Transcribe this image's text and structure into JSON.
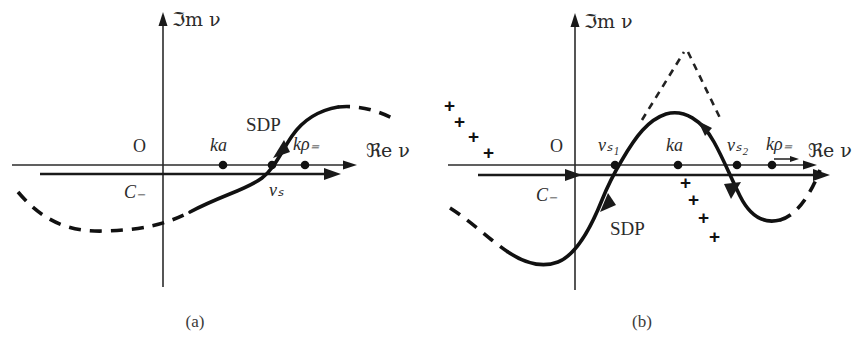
{
  "figure": {
    "width": 859,
    "height": 345,
    "background": "#ffffff",
    "ink_color": "#111111",
    "axis_color": "#2b2b2b"
  },
  "panels": [
    {
      "id": "a",
      "caption": "(a)",
      "axes": {
        "y_label": "ℑm ν",
        "x_label": "ℜe ν",
        "origin_label": "O",
        "origin_x": 163,
        "origin_y": 165
      },
      "contour": {
        "label": "C₋",
        "label_x": 128,
        "label_y": 193,
        "y": 174,
        "x_start": 12,
        "x_end": 318
      },
      "points": [
        {
          "label": "ka",
          "x": 223,
          "y": 165,
          "label_x": 223,
          "label_y": 148
        },
        {
          "label": "νₛ",
          "x": 272,
          "y": 165,
          "label_x": 281,
          "label_y": 191
        },
        {
          "label": "kρ₌",
          "x": 305,
          "y": 165,
          "label_x": 308,
          "label_y": 147
        }
      ],
      "curve": {
        "name": "SDP",
        "label": "SDP",
        "label_x": 249,
        "label_y": 126,
        "description": "monotonically increasing S-shaped steepest descent path crossing the real axis at nu_s, solid in the middle, dashed at both far ends",
        "direction": "upward"
      }
    },
    {
      "id": "b",
      "caption": "(b)",
      "axes": {
        "y_label": "ℑm ν",
        "x_label": "ℜe ν",
        "origin_label": "O",
        "origin_x": 145,
        "origin_y": 165
      },
      "contour": {
        "label": "C₋",
        "label_x": 108,
        "label_y": 196,
        "y": 175,
        "x_start": 18,
        "x_end": 398
      },
      "points": [
        {
          "label": "νₛ₁",
          "x": 185,
          "y": 165,
          "label_x": 180,
          "label_y": 148
        },
        {
          "label": "ka",
          "x": 248,
          "y": 165,
          "label_x": 249,
          "label_y": 148
        },
        {
          "label": "νₛ₂",
          "x": 307,
          "y": 165,
          "label_x": 312,
          "label_y": 148
        },
        {
          "label": "kρ₌",
          "x": 342,
          "y": 165,
          "label_x": 350,
          "label_y": 147
        }
      ],
      "curve": {
        "name": "SDP",
        "label": "SDP",
        "label_x": 205,
        "label_y": 228,
        "description": "sinusoidal steepest descent path rising through nu_s1, peaking between nu_s1 and nu_s2, descending through nu_s2; solid in the middle, dashed at both far ends",
        "direction": "upward then downward"
      },
      "dashed_peak": {
        "description": "dashed inverted-V spike above the solid hump",
        "apex_x": 256,
        "apex_y": 53
      },
      "plus_groups": [
        {
          "name": "left-branch-cut-crosses",
          "count": 4,
          "positions": [
            [
              14,
              112
            ],
            [
              24,
              127
            ],
            [
              38,
              142
            ],
            [
              53,
              158
            ]
          ]
        },
        {
          "name": "right-branch-cut-crosses",
          "count": 4,
          "positions": [
            [
              684,
              182
            ],
            [
              691,
              198
            ],
            [
              702,
              216
            ],
            [
              712,
              235
            ]
          ]
        }
      ]
    }
  ]
}
